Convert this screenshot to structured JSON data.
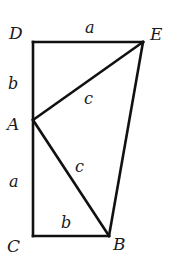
{
  "diagram": {
    "points": {
      "D": {
        "label": "D",
        "x": 33,
        "y": 42
      },
      "E": {
        "label": "E",
        "x": 143,
        "y": 42
      },
      "A": {
        "label": "A",
        "x": 33,
        "y": 120
      },
      "C": {
        "label": "C",
        "x": 33,
        "y": 236
      },
      "B": {
        "label": "B",
        "x": 109,
        "y": 236
      }
    },
    "point_labels": {
      "D": "D",
      "E": "E",
      "A": "A",
      "C": "C",
      "B": "B"
    },
    "segments": [
      {
        "from": "D",
        "to": "E",
        "label": "a"
      },
      {
        "from": "D",
        "to": "A",
        "label": "b"
      },
      {
        "from": "A",
        "to": "E",
        "label": "c"
      },
      {
        "from": "A",
        "to": "B",
        "label": "c"
      },
      {
        "from": "A",
        "to": "C",
        "label": "a"
      },
      {
        "from": "C",
        "to": "B",
        "label": "b"
      },
      {
        "from": "B",
        "to": "E",
        "label": ""
      }
    ],
    "segment_labels": {
      "DE": "a",
      "DA": "b",
      "AE": "c",
      "AB": "c",
      "AC": "a",
      "CB": "b"
    },
    "colors": {
      "stroke": "#111111",
      "text": "#1a1a1a",
      "background": "#ffffff"
    }
  }
}
